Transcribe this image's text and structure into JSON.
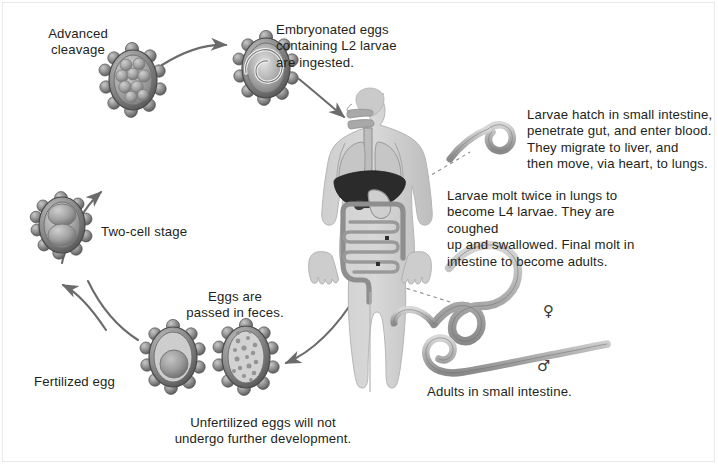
{
  "figure": {
    "background_color": "#ffffff",
    "text_color": "#231f20",
    "arrow_color": "#6b6b6b",
    "organ_liver_color": "#2b2b2b",
    "body_fill_color": "#d2d2d2",
    "egg_shell_color": "#8c8c8c"
  },
  "labels": {
    "advanced_cleavage": "Advanced\ncleavage",
    "embryonated_eggs": "Embryonated eggs\ncontaining L2 larvae\nare ingested.",
    "two_cell_stage": "Two-cell stage",
    "fertilized_egg": "Fertilized egg",
    "eggs_passed": "Eggs are\npassed in feces.",
    "unfertilized_eggs": "Unfertilized eggs will not\nundergo further development.",
    "larvae_hatch": "Larvae hatch in small intestine,\npenetrate gut, and enter blood.\nThey migrate to liver, and\nthen move, via heart, to lungs.",
    "larvae_molt": "Larvae molt twice in lungs to\nbecome L4 larvae. They are coughed\nup and swallowed. Final molt in\nintestine to become adults.",
    "adults": "Adults in small intestine.",
    "female_symbol": "♀",
    "male_symbol": "♂"
  },
  "stages": [
    {
      "name": "two-cell-stage",
      "label": "Two-cell stage",
      "order": 1
    },
    {
      "name": "advanced-cleavage",
      "label": "Advanced cleavage",
      "order": 2
    },
    {
      "name": "embryonated-egg",
      "label": "Embryonated eggs containing L2 larvae are ingested.",
      "order": 3
    },
    {
      "name": "human-host",
      "label": "Human host",
      "order": 4
    },
    {
      "name": "unfertilized-egg",
      "label": "Unfertilized eggs will not undergo further development.",
      "order": 5
    },
    {
      "name": "fertilized-egg",
      "label": "Fertilized egg",
      "order": 6
    }
  ],
  "organisms": {
    "larva_coiled": "L2 larva",
    "adult_female": "Adult female worm",
    "adult_male": "Adult male worm"
  },
  "organs": [
    {
      "name": "lungs"
    },
    {
      "name": "liver"
    },
    {
      "name": "stomach"
    },
    {
      "name": "small-intestine"
    },
    {
      "name": "large-intestine"
    },
    {
      "name": "esophagus"
    }
  ]
}
